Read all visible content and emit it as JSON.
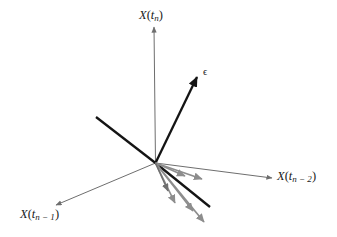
{
  "figure": {
    "type": "vector-diagram",
    "background_color": "#ffffff",
    "width": 337,
    "height": 237,
    "origin": {
      "x": 155.5,
      "y": 163.0
    },
    "colors": {
      "axis": "#6e6e6e",
      "black_vector": "#141414",
      "gray_vector": "#8d8d8d",
      "gray_vector_dark": "#707070",
      "text": "#1a1a1a"
    },
    "labels": {
      "x_tn": {
        "text": "X(t_n)",
        "base": "X",
        "open": "(",
        "t": "t",
        "sub": "n",
        "close": ")"
      },
      "x_tn_minus_1": {
        "text": "X(t_n − 1)",
        "base": "X",
        "open": "(",
        "t": "t",
        "sub": "n − 1",
        "close": ")"
      },
      "x_tn_minus_2": {
        "text": "X(t_n − 2)",
        "base": "X",
        "open": "(",
        "t": "t",
        "sub": "n − 2",
        "close": ")"
      },
      "epsilon": {
        "text": "ϵ"
      }
    },
    "axes": [
      {
        "name": "x-tn-axis",
        "x1": 155.5,
        "y1": 163.0,
        "x2": 154.0,
        "y2": 27.0,
        "arrow": true,
        "color": "#6e6e6e",
        "width": 1.0
      },
      {
        "name": "x-tn-2-axis",
        "x1": 155.5,
        "y1": 163.0,
        "x2": 272.0,
        "y2": 178.0,
        "arrow": true,
        "color": "#6e6e6e",
        "width": 1.0
      },
      {
        "name": "x-tn-1-axis",
        "x1": 155.5,
        "y1": 163.0,
        "x2": 56.0,
        "y2": 205.0,
        "arrow": true,
        "color": "#6e6e6e",
        "width": 1.0
      }
    ],
    "vectors": [
      {
        "name": "epsilon-vector",
        "x1": 155.5,
        "y1": 163.0,
        "x2": 197.0,
        "y2": 77.0,
        "arrow": true,
        "color": "#141414",
        "width": 2.3
      },
      {
        "name": "upper-left-vector",
        "x1": 155.5,
        "y1": 163.0,
        "x2": 96.0,
        "y2": 117.0,
        "arrow": false,
        "color": "#141414",
        "width": 2.3
      },
      {
        "name": "black-fan-vector",
        "x1": 155.5,
        "y1": 163.0,
        "x2": 210.0,
        "y2": 207.0,
        "arrow": false,
        "color": "#141414",
        "width": 2.3
      },
      {
        "name": "gray-fan-vector-1",
        "x1": 155.5,
        "y1": 163.0,
        "x2": 202.0,
        "y2": 179.0,
        "arrow": true,
        "color": "#8d8d8d",
        "width": 1.7
      },
      {
        "name": "gray-fan-vector-2",
        "x1": 155.5,
        "y1": 163.0,
        "x2": 185.0,
        "y2": 176.0,
        "arrow": true,
        "color": "#8d8d8d",
        "width": 1.7
      },
      {
        "name": "gray-fan-vector-3",
        "x1": 155.5,
        "y1": 163.0,
        "x2": 175.0,
        "y2": 203.0,
        "arrow": true,
        "color": "#8d8d8d",
        "width": 1.7
      },
      {
        "name": "gray-fan-vector-4",
        "x1": 155.5,
        "y1": 163.0,
        "x2": 193.0,
        "y2": 211.0,
        "arrow": true,
        "color": "#8d8d8d",
        "width": 1.7
      },
      {
        "name": "gray-fan-vector-5",
        "x1": 155.5,
        "y1": 163.0,
        "x2": 204.0,
        "y2": 222.0,
        "arrow": true,
        "color": "#8d8d8d",
        "width": 1.7
      },
      {
        "name": "gray-fan-vector-6",
        "x1": 155.5,
        "y1": 163.0,
        "x2": 168.0,
        "y2": 191.0,
        "arrow": true,
        "color": "#707070",
        "width": 1.5
      }
    ]
  }
}
